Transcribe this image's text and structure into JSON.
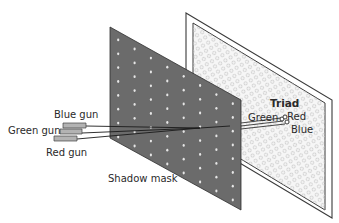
{
  "diagram": {
    "type": "cathode-ray-tube-shadow-mask",
    "labels": {
      "blue_gun": "Blue gun",
      "green_gun": "Green gun",
      "red_gun": "Red gun",
      "shadow_mask": "Shadow mask",
      "triad": "Triad",
      "triad_green": "Green",
      "triad_red": "Red",
      "triad_blue": "Blue"
    },
    "colors": {
      "mask_fill": "#6e6e6e",
      "mask_hole": "#e8e8e8",
      "screen_fill": "#f4f4f4",
      "screen_pattern": "#c9c9c9",
      "outline": "#3a3a3a",
      "gun_fill": "#b0b0b0",
      "beam": "#1a1a1a"
    }
  }
}
